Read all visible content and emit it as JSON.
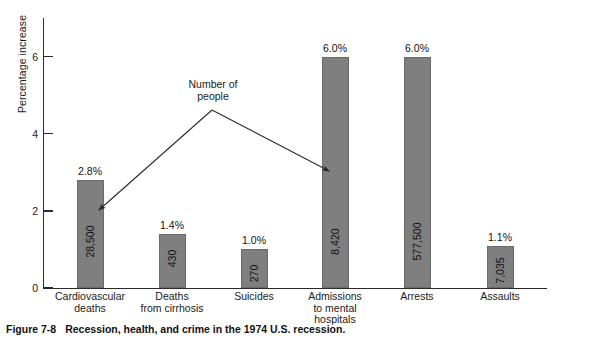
{
  "figure": {
    "caption_number": "Figure 7-8",
    "caption_text": "Recession, health, and crime in the 1974 U.S. recession."
  },
  "chart_data": {
    "type": "bar",
    "title": "",
    "xlabel": "",
    "ylabel": "Percentage increase",
    "ylim": [
      0,
      7
    ],
    "yticks": [
      0,
      2,
      4,
      6
    ],
    "ytick_labels": [
      "0",
      "2",
      "4",
      "6"
    ],
    "grid": false,
    "legend": null,
    "categories": [
      "Cardiovascular\ndeaths",
      "Deaths\nfrom cirrhosis",
      "Suicides",
      "Admissions\nto mental\nhospitals",
      "Arrests",
      "Assaults"
    ],
    "values": [
      2.8,
      1.4,
      1.0,
      6.0,
      6.0,
      1.1
    ],
    "value_labels": [
      "2.8%",
      "1.4%",
      "1.0%",
      "6.0%",
      "6.0%",
      "1.1%"
    ],
    "count_labels": [
      "28,500",
      "430",
      "270",
      "8,420",
      "577,500",
      "7,035"
    ],
    "bar_color": "#7f7f7f",
    "annotations": [
      {
        "text": "Number of\npeople",
        "points_to": [
          "28,500",
          "8,420"
        ]
      }
    ]
  }
}
